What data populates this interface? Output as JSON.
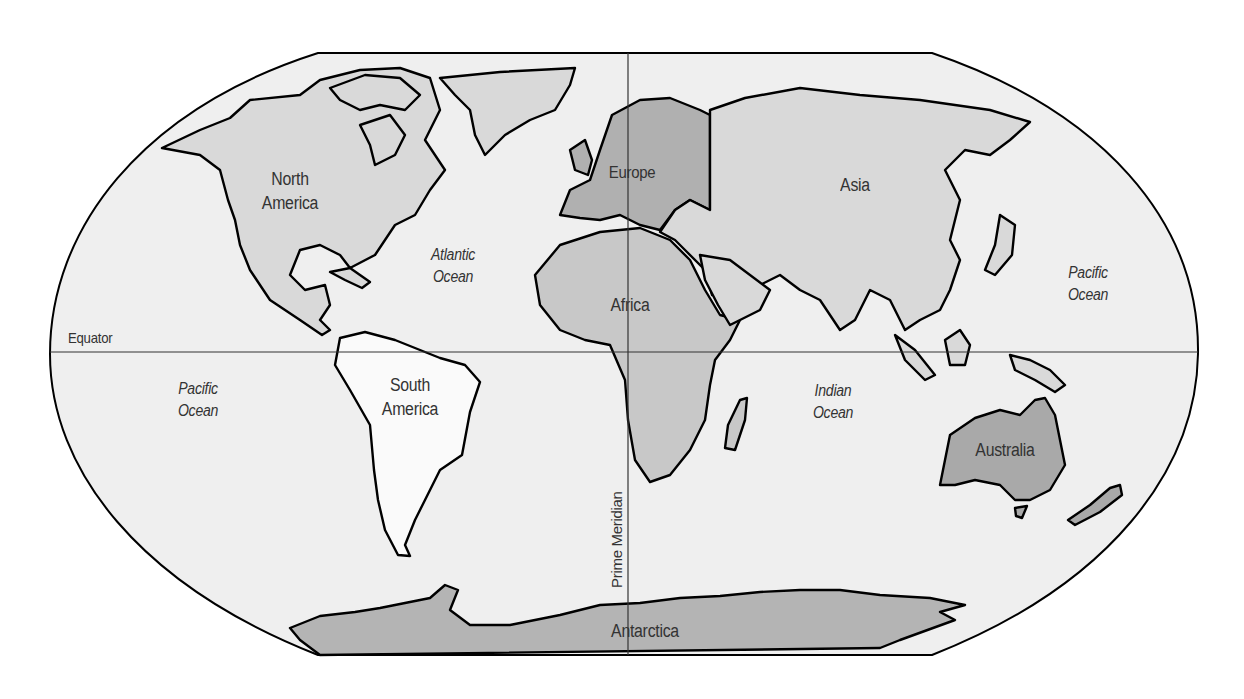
{
  "map": {
    "projection": "Robinson-style world map",
    "colors": {
      "ocean": "#efefef",
      "north_america": "#d9d9d9",
      "south_america": "#fafafa",
      "europe": "#b0b0b0",
      "asia": "#d9d9d9",
      "africa": "#c8c8c8",
      "australia": "#a9a9a9",
      "antarctica": "#b4b4b4",
      "outline": "#000000"
    },
    "continents": [
      {
        "id": "north_america",
        "label": "North America",
        "label_lines": [
          "North",
          "America"
        ]
      },
      {
        "id": "south_america",
        "label": "South America",
        "label_lines": [
          "South",
          "America"
        ]
      },
      {
        "id": "europe",
        "label": "Europe"
      },
      {
        "id": "asia",
        "label": "Asia"
      },
      {
        "id": "africa",
        "label": "Africa"
      },
      {
        "id": "australia",
        "label": "Australia"
      },
      {
        "id": "antarctica",
        "label": "Antarctica"
      }
    ],
    "oceans": [
      {
        "id": "atlantic",
        "label": "Atlantic\nOcean"
      },
      {
        "id": "pacific_west",
        "label": "Pacific\nOcean"
      },
      {
        "id": "pacific_east",
        "label": "Pacific\nOcean"
      },
      {
        "id": "indian",
        "label": "Indian\nOcean"
      }
    ],
    "reference_lines": {
      "equator": "Equator",
      "prime_meridian": "Prime Meridian"
    }
  }
}
